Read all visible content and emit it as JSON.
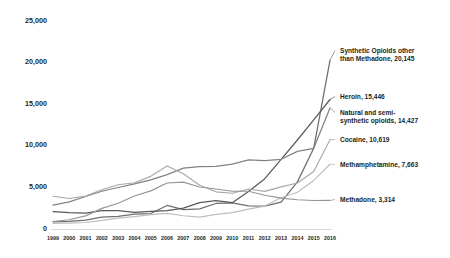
{
  "chart_data": {
    "type": "line",
    "title": "",
    "subtitle": "",
    "xlabel": "",
    "ylabel": "",
    "grid": false,
    "legend_position": "right-inline-labels",
    "x": [
      1999,
      2000,
      2001,
      2002,
      2003,
      2004,
      2005,
      2006,
      2007,
      2008,
      2009,
      2010,
      2011,
      2012,
      2013,
      2014,
      2015,
      2016
    ],
    "xtick_labels": [
      "1999",
      "2000",
      "2001",
      "2002",
      "2003",
      "2004",
      "2005",
      "2006",
      "2007",
      "2008",
      "2009",
      "2010",
      "2011",
      "2012",
      "2013",
      "2014",
      "2015",
      "2016"
    ],
    "ylim": [
      0,
      25000
    ],
    "ytick_values": [
      0,
      5000,
      10000,
      15000,
      20000,
      25000
    ],
    "ytick_labels": [
      "0",
      "5,000",
      "10,000",
      "15,000",
      "20,000",
      "25,000"
    ],
    "series": [
      {
        "name": "Synthetic Opioids other than Methadone",
        "label": "Synthetic Opioids other than Methadone, 20,145",
        "label_lines": [
          "Synthetic Opioids other",
          "than Methadone, 20,145"
        ],
        "end_value": 20145,
        "color": "#6d6e71",
        "width": 1.25,
        "values": [
          730,
          782,
          957,
          1295,
          1400,
          1664,
          1742,
          2707,
          2213,
          2306,
          2946,
          3007,
          2666,
          2628,
          3105,
          5544,
          9580,
          20145
        ]
      },
      {
        "name": "Heroin",
        "label": "Heroin, 15,446",
        "label_lines": [
          "Heroin, 15,446"
        ],
        "end_value": 15446,
        "color": "#58595b",
        "width": 1.25,
        "values": [
          1960,
          1842,
          1779,
          2089,
          2080,
          1878,
          2009,
          2088,
          2399,
          3041,
          3278,
          3036,
          4397,
          5925,
          8257,
          10574,
          12989,
          15446
        ]
      },
      {
        "name": "Natural and semi-synthetic opioids",
        "label": "Natural and semi-synthetic opioids, 14,427",
        "label_lines": [
          "Natural and semi-",
          "synthetic opioids, 14,427"
        ],
        "end_value": 14427,
        "color": "#808285",
        "width": 1.25,
        "values": [
          2749,
          3137,
          3790,
          4416,
          4867,
          5291,
          5774,
          6423,
          7198,
          7373,
          7408,
          7684,
          8194,
          8105,
          8257,
          9203,
          9580,
          14427
        ]
      },
      {
        "name": "Cocaine",
        "label": "Cocaine, 10,619",
        "label_lines": [
          "Cocaine, 10,619"
        ],
        "end_value": 10619,
        "color": "#a7a9ac",
        "width": 1.15,
        "values": [
          3822,
          3544,
          3833,
          4599,
          5198,
          5443,
          6208,
          7448,
          6512,
          5129,
          4350,
          4183,
          4681,
          4404,
          4944,
          5415,
          6784,
          10619
        ]
      },
      {
        "name": "Methamphetamine",
        "label": "Methamphetamine, 7,663",
        "label_lines": [
          "Methamphetamine, 7,663"
        ],
        "end_value": 7663,
        "color": "#bcbec0",
        "width": 1.15,
        "values": [
          547,
          586,
          655,
          915,
          1194,
          1371,
          1608,
          1759,
          1467,
          1304,
          1645,
          1854,
          2266,
          2635,
          3627,
          4298,
          5716,
          7663
        ]
      },
      {
        "name": "Methadone",
        "label": "Methadone, 3,314",
        "label_lines": [
          "Methadone, 3,314"
        ],
        "end_value": 3314,
        "color": "#939598",
        "width": 1.15,
        "values": [
          784,
          988,
          1456,
          2360,
          2974,
          3849,
          4460,
          5406,
          5518,
          4924,
          4684,
          4418,
          4418,
          3932,
          3591,
          3400,
          3301,
          3314
        ]
      }
    ]
  },
  "labels": {
    "synthetic_line1": "Synthetic Opioids other",
    "synthetic_line2": "than Methadone, 20,145",
    "heroin": "Heroin, 15,446",
    "natural_line1": "Natural and semi-",
    "natural_line2": "synthetic opioids, 14,427",
    "cocaine": "Cocaine, 10,619",
    "methamphetamine": "Methamphetamine, 7,663",
    "methadone": "Methadone, 3,314"
  },
  "axis": {
    "y": {
      "t0": "0",
      "t1": "5,000",
      "t2": "10,000",
      "t3": "15,000",
      "t4": "20,000",
      "t5": "25,000"
    }
  }
}
